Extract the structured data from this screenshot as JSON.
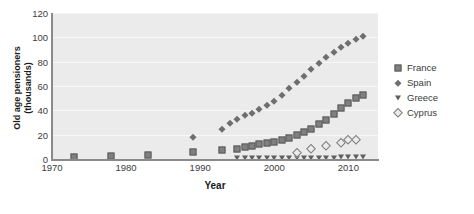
{
  "chart_data": {
    "type": "scatter",
    "title": "",
    "xlabel": "Year",
    "ylabel": "Old age pensioners\n(thousands)",
    "xlim": [
      1970,
      2014
    ],
    "ylim": [
      0,
      120
    ],
    "yticks": [
      0,
      20,
      40,
      60,
      80,
      100,
      120
    ],
    "xticks": [
      1970,
      1980,
      1990,
      2000,
      2010
    ],
    "grid": "horizontal",
    "legend_position": "right",
    "series": [
      {
        "name": "France",
        "marker": "square",
        "points": [
          [
            1973,
            2.0
          ],
          [
            1978,
            2.8
          ],
          [
            1983,
            3.5
          ],
          [
            1989,
            6.0
          ],
          [
            1993,
            7.0
          ],
          [
            1995,
            8.5
          ],
          [
            1996,
            10.0
          ],
          [
            1997,
            11.0
          ],
          [
            1998,
            12.0
          ],
          [
            1999,
            13.0
          ],
          [
            2000,
            14.0
          ],
          [
            2001,
            15.5
          ],
          [
            2002,
            17.0
          ],
          [
            2003,
            19.5
          ],
          [
            2004,
            22.0
          ],
          [
            2005,
            25.0
          ],
          [
            2006,
            28.5
          ],
          [
            2007,
            32.0
          ],
          [
            2008,
            37.0
          ],
          [
            2009,
            42.0
          ],
          [
            2010,
            46.0
          ],
          [
            2011,
            50.0
          ],
          [
            2012,
            53.0
          ]
        ]
      },
      {
        "name": "Spain",
        "marker": "diamond",
        "points": [
          [
            1989,
            18.0
          ],
          [
            1993,
            25.0
          ],
          [
            1994,
            30.0
          ],
          [
            1995,
            33.0
          ],
          [
            1996,
            36.0
          ],
          [
            1997,
            38.0
          ],
          [
            1998,
            41.0
          ],
          [
            1999,
            44.0
          ],
          [
            2000,
            48.0
          ],
          [
            2001,
            53.0
          ],
          [
            2002,
            58.0
          ],
          [
            2003,
            63.0
          ],
          [
            2004,
            68.0
          ],
          [
            2005,
            74.0
          ],
          [
            2006,
            79.0
          ],
          [
            2007,
            84.0
          ],
          [
            2008,
            88.0
          ],
          [
            2009,
            92.0
          ],
          [
            2010,
            95.0
          ],
          [
            2011,
            99.0
          ],
          [
            2012,
            101.0
          ]
        ]
      },
      {
        "name": "Greece",
        "marker": "triangle-down",
        "points": [
          [
            1995,
            0.6
          ],
          [
            1996,
            0.6
          ],
          [
            1997,
            0.7
          ],
          [
            1998,
            0.7
          ],
          [
            1999,
            0.8
          ],
          [
            2000,
            0.8
          ],
          [
            2001,
            0.9
          ],
          [
            2002,
            0.9
          ],
          [
            2003,
            1.0
          ],
          [
            2004,
            1.0
          ],
          [
            2005,
            1.1
          ],
          [
            2006,
            1.1
          ],
          [
            2007,
            1.2
          ],
          [
            2008,
            1.2
          ],
          [
            2009,
            1.3
          ],
          [
            2010,
            1.3
          ],
          [
            2011,
            1.4
          ],
          [
            2012,
            1.4
          ]
        ]
      },
      {
        "name": "Cyprus",
        "marker": "diamond-open",
        "points": [
          [
            2003,
            5.0
          ],
          [
            2005,
            8.0
          ],
          [
            2007,
            11.0
          ],
          [
            2009,
            13.0
          ],
          [
            2010,
            15.5
          ],
          [
            2011,
            15.5
          ]
        ]
      }
    ]
  },
  "legend": {
    "items": [
      {
        "label": "France",
        "marker": "square"
      },
      {
        "label": "Spain",
        "marker": "diamond"
      },
      {
        "label": "Greece",
        "marker": "triangle-down"
      },
      {
        "label": "Cyprus",
        "marker": "diamond-open"
      }
    ]
  }
}
